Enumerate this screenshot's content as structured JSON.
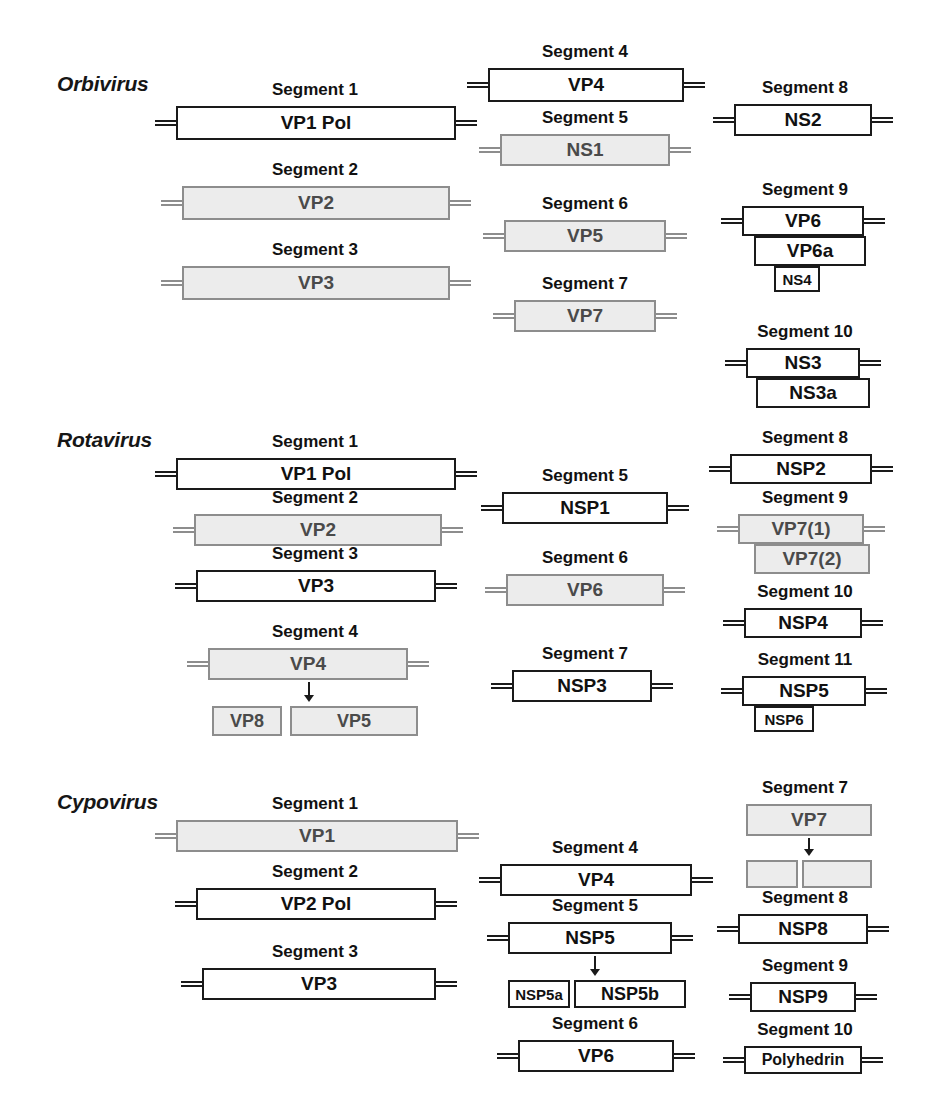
{
  "figure": {
    "width": 930,
    "height": 1109,
    "background": "#ffffff",
    "colors": {
      "box_stroke_dark": "#1a1a1a",
      "box_stroke_gray": "#8d8d8d",
      "box_fill_white": "#ffffff",
      "box_fill_gray": "#ececec",
      "text_dark": "#111111",
      "text_gray": "#4a4a4a"
    }
  },
  "genera": [
    {
      "name": "Orbivirus",
      "label_x": 57,
      "label_y": 72,
      "segments": [
        {
          "title": "Segment 1",
          "x": 150,
          "y": 80,
          "w": 330,
          "title_w": 330,
          "orfs": [
            {
              "label": "VP1 Pol",
              "x": 26,
              "y": 26,
              "w": 280,
              "h": 34,
              "style": "fill-white",
              "font": 19,
              "utr_left": true,
              "utr_right": true
            }
          ]
        },
        {
          "title": "Segment 2",
          "x": 150,
          "y": 160,
          "w": 330,
          "title_w": 330,
          "orfs": [
            {
              "label": "VP2",
              "x": 32,
              "y": 26,
              "w": 268,
              "h": 34,
              "style": "fill-gray",
              "font": 19,
              "utr_left": true,
              "utr_right": true
            }
          ]
        },
        {
          "title": "Segment 3",
          "x": 150,
          "y": 240,
          "w": 330,
          "title_w": 330,
          "orfs": [
            {
              "label": "VP3",
              "x": 32,
              "y": 26,
              "w": 268,
              "h": 34,
              "style": "fill-gray",
              "font": 19,
              "utr_left": true,
              "utr_right": true
            }
          ]
        },
        {
          "title": "Segment 4",
          "x": 460,
          "y": 42,
          "w": 250,
          "title_w": 250,
          "orfs": [
            {
              "label": "VP4",
              "x": 28,
              "y": 26,
              "w": 196,
              "h": 34,
              "style": "fill-white",
              "font": 19,
              "utr_left": true,
              "utr_right": true
            }
          ]
        },
        {
          "title": "Segment 5",
          "x": 460,
          "y": 108,
          "w": 250,
          "title_w": 250,
          "orfs": [
            {
              "label": "NS1",
              "x": 40,
              "y": 26,
              "w": 170,
              "h": 32,
              "style": "fill-gray",
              "font": 19,
              "utr_left": true,
              "utr_right": true
            }
          ]
        },
        {
          "title": "Segment 6",
          "x": 460,
          "y": 194,
          "w": 250,
          "title_w": 250,
          "orfs": [
            {
              "label": "VP5",
              "x": 44,
              "y": 26,
              "w": 162,
              "h": 32,
              "style": "fill-gray",
              "font": 19,
              "utr_left": true,
              "utr_right": true
            }
          ]
        },
        {
          "title": "Segment 7",
          "x": 460,
          "y": 274,
          "w": 250,
          "title_w": 250,
          "orfs": [
            {
              "label": "VP7",
              "x": 54,
              "y": 26,
              "w": 142,
              "h": 32,
              "style": "fill-gray",
              "font": 19,
              "utr_left": true,
              "utr_right": true
            }
          ]
        },
        {
          "title": "Segment 8",
          "x": 700,
          "y": 78,
          "w": 210,
          "title_w": 210,
          "orfs": [
            {
              "label": "NS2",
              "x": 34,
              "y": 26,
              "w": 138,
              "h": 32,
              "style": "fill-white",
              "font": 19,
              "utr_left": true,
              "utr_right": true
            }
          ]
        },
        {
          "title": "Segment 9",
          "x": 700,
          "y": 180,
          "w": 210,
          "title_w": 210,
          "orfs": [
            {
              "label": "VP6",
              "x": 42,
              "y": 26,
              "w": 122,
              "h": 30,
              "style": "fill-white",
              "font": 19,
              "utr_left": true,
              "utr_right": true
            },
            {
              "label": "VP6a",
              "x": 54,
              "y": 56,
              "w": 112,
              "h": 30,
              "style": "fill-white",
              "font": 19,
              "utr_left": false,
              "utr_right": false
            },
            {
              "label": "NS4",
              "x": 74,
              "y": 86,
              "w": 46,
              "h": 26,
              "style": "fill-white",
              "font": 15,
              "utr_left": false,
              "utr_right": false
            }
          ]
        },
        {
          "title": "Segment 10",
          "x": 700,
          "y": 322,
          "w": 210,
          "title_w": 210,
          "orfs": [
            {
              "label": "NS3",
              "x": 46,
              "y": 26,
              "w": 114,
              "h": 30,
              "style": "fill-white",
              "font": 19,
              "utr_left": true,
              "utr_right": true
            },
            {
              "label": "NS3a",
              "x": 56,
              "y": 56,
              "w": 114,
              "h": 30,
              "style": "fill-white",
              "font": 19,
              "utr_left": false,
              "utr_right": false
            }
          ]
        }
      ]
    },
    {
      "name": "Rotavirus",
      "label_x": 57,
      "label_y": 428,
      "segments": [
        {
          "title": "Segment 1",
          "x": 150,
          "y": 432,
          "w": 330,
          "title_w": 330,
          "orfs": [
            {
              "label": "VP1 Pol",
              "x": 26,
              "y": 26,
              "w": 280,
              "h": 32,
              "style": "fill-white",
              "font": 19,
              "utr_left": true,
              "utr_right": true
            }
          ]
        },
        {
          "title": "Segment 2",
          "x": 150,
          "y": 488,
          "w": 330,
          "title_w": 330,
          "orfs": [
            {
              "label": "VP2",
              "x": 44,
              "y": 26,
              "w": 248,
              "h": 32,
              "style": "fill-gray",
              "font": 19,
              "utr_left": true,
              "utr_right": true
            }
          ]
        },
        {
          "title": "Segment 3",
          "x": 150,
          "y": 544,
          "w": 330,
          "title_w": 330,
          "orfs": [
            {
              "label": "VP3",
              "x": 46,
              "y": 26,
              "w": 240,
              "h": 32,
              "style": "fill-white",
              "font": 19,
              "utr_left": true,
              "utr_right": true
            }
          ]
        },
        {
          "title": "Segment 4",
          "x": 150,
          "y": 622,
          "w": 330,
          "title_w": 330,
          "orfs": [
            {
              "label": "VP4",
              "x": 58,
              "y": 26,
              "w": 200,
              "h": 32,
              "style": "fill-gray",
              "font": 19,
              "utr_left": true,
              "utr_right": true
            }
          ],
          "arrow": {
            "x": 152,
            "y": 60,
            "h": 20
          },
          "products": [
            {
              "label": "VP8",
              "x": 62,
              "y": 84,
              "w": 70,
              "h": 30,
              "style": "fill-gray",
              "font": 18
            },
            {
              "label": "VP5",
              "x": 140,
              "y": 84,
              "w": 128,
              "h": 30,
              "style": "fill-gray",
              "font": 18
            }
          ]
        },
        {
          "title": "Segment 5",
          "x": 460,
          "y": 466,
          "w": 250,
          "title_w": 250,
          "orfs": [
            {
              "label": "NSP1",
              "x": 42,
              "y": 26,
              "w": 166,
              "h": 32,
              "style": "fill-white",
              "font": 19,
              "utr_left": true,
              "utr_right": true
            }
          ]
        },
        {
          "title": "Segment 6",
          "x": 460,
          "y": 548,
          "w": 250,
          "title_w": 250,
          "orfs": [
            {
              "label": "VP6",
              "x": 46,
              "y": 26,
              "w": 158,
              "h": 32,
              "style": "fill-gray",
              "font": 19,
              "utr_left": true,
              "utr_right": true
            }
          ]
        },
        {
          "title": "Segment 7",
          "x": 460,
          "y": 644,
          "w": 250,
          "title_w": 250,
          "orfs": [
            {
              "label": "NSP3",
              "x": 52,
              "y": 26,
              "w": 140,
              "h": 32,
              "style": "fill-white",
              "font": 19,
              "utr_left": true,
              "utr_right": true
            }
          ]
        },
        {
          "title": "Segment 8",
          "x": 700,
          "y": 428,
          "w": 210,
          "title_w": 210,
          "orfs": [
            {
              "label": "NSP2",
              "x": 30,
              "y": 26,
              "w": 142,
              "h": 30,
              "style": "fill-white",
              "font": 19,
              "utr_left": true,
              "utr_right": true
            }
          ]
        },
        {
          "title": "Segment 9",
          "x": 700,
          "y": 488,
          "w": 210,
          "title_w": 210,
          "orfs": [
            {
              "label": "VP7(1)",
              "x": 38,
              "y": 26,
              "w": 126,
              "h": 30,
              "style": "fill-gray",
              "font": 19,
              "utr_left": true,
              "utr_right": true
            },
            {
              "label": "VP7(2)",
              "x": 54,
              "y": 56,
              "w": 116,
              "h": 30,
              "style": "fill-gray",
              "font": 19,
              "utr_left": false,
              "utr_right": false
            }
          ]
        },
        {
          "title": "Segment 10",
          "x": 700,
          "y": 582,
          "w": 210,
          "title_w": 210,
          "orfs": [
            {
              "label": "NSP4",
              "x": 44,
              "y": 26,
              "w": 118,
              "h": 30,
              "style": "fill-white",
              "font": 19,
              "utr_left": true,
              "utr_right": true
            }
          ]
        },
        {
          "title": "Segment 11",
          "x": 700,
          "y": 650,
          "w": 210,
          "title_w": 210,
          "orfs": [
            {
              "label": "NSP5",
              "x": 42,
              "y": 26,
              "w": 124,
              "h": 30,
              "style": "fill-white",
              "font": 19,
              "utr_left": true,
              "utr_right": true
            },
            {
              "label": "NSP6",
              "x": 54,
              "y": 56,
              "w": 60,
              "h": 26,
              "style": "fill-white",
              "font": 15,
              "utr_left": false,
              "utr_right": false
            }
          ]
        }
      ]
    },
    {
      "name": "Cypovirus",
      "label_x": 57,
      "label_y": 790,
      "segments": [
        {
          "title": "Segment 1",
          "x": 150,
          "y": 794,
          "w": 330,
          "title_w": 330,
          "orfs": [
            {
              "label": "VP1",
              "x": 26,
              "y": 26,
              "w": 282,
              "h": 32,
              "style": "fill-gray",
              "font": 19,
              "utr_left": true,
              "utr_right": true
            }
          ]
        },
        {
          "title": "Segment 2",
          "x": 150,
          "y": 862,
          "w": 330,
          "title_w": 330,
          "orfs": [
            {
              "label": "VP2 Pol",
              "x": 46,
              "y": 26,
              "w": 240,
              "h": 32,
              "style": "fill-white",
              "font": 19,
              "utr_left": true,
              "utr_right": true
            }
          ]
        },
        {
          "title": "Segment 3",
          "x": 150,
          "y": 942,
          "w": 330,
          "title_w": 330,
          "orfs": [
            {
              "label": "VP3",
              "x": 52,
              "y": 26,
              "w": 234,
              "h": 32,
              "style": "fill-white",
              "font": 19,
              "utr_left": true,
              "utr_right": true
            }
          ]
        },
        {
          "title": "Segment 4",
          "x": 470,
          "y": 838,
          "w": 250,
          "title_w": 250,
          "orfs": [
            {
              "label": "VP4",
              "x": 30,
              "y": 26,
              "w": 192,
              "h": 32,
              "style": "fill-white",
              "font": 19,
              "utr_left": true,
              "utr_right": true
            }
          ]
        },
        {
          "title": "Segment 5",
          "x": 470,
          "y": 896,
          "w": 250,
          "title_w": 250,
          "orfs": [
            {
              "label": "NSP5",
              "x": 38,
              "y": 26,
              "w": 164,
              "h": 32,
              "style": "fill-white",
              "font": 19,
              "utr_left": true,
              "utr_right": true
            }
          ],
          "arrow": {
            "x": 118,
            "y": 60,
            "h": 20
          },
          "products": [
            {
              "label": "NSP5a",
              "x": 38,
              "y": 84,
              "w": 62,
              "h": 28,
              "style": "fill-white",
              "font": 15
            },
            {
              "label": "NSP5b",
              "x": 104,
              "y": 84,
              "w": 112,
              "h": 28,
              "style": "fill-white",
              "font": 18
            }
          ]
        },
        {
          "title": "Segment 6",
          "x": 470,
          "y": 1014,
          "w": 250,
          "title_w": 250,
          "orfs": [
            {
              "label": "VP6",
              "x": 48,
              "y": 26,
              "w": 156,
              "h": 32,
              "style": "fill-white",
              "font": 19,
              "utr_left": true,
              "utr_right": true
            }
          ]
        },
        {
          "title": "Segment 7",
          "x": 700,
          "y": 778,
          "w": 210,
          "title_w": 210,
          "orfs": [
            {
              "label": "VP7",
              "x": 46,
              "y": 26,
              "w": 126,
              "h": 32,
              "style": "fill-gray",
              "font": 19,
              "utr_left": false,
              "utr_right": false
            }
          ],
          "arrow": {
            "x": 102,
            "y": 60,
            "h": 18
          },
          "products": [
            {
              "label": "",
              "x": 46,
              "y": 82,
              "w": 52,
              "h": 28,
              "style": "fill-gray",
              "font": 15
            },
            {
              "label": "",
              "x": 102,
              "y": 82,
              "w": 70,
              "h": 28,
              "style": "fill-gray",
              "font": 15
            }
          ]
        },
        {
          "title": "Segment 8",
          "x": 700,
          "y": 888,
          "w": 210,
          "title_w": 210,
          "orfs": [
            {
              "label": "NSP8",
              "x": 38,
              "y": 26,
              "w": 130,
              "h": 30,
              "style": "fill-white",
              "font": 19,
              "utr_left": true,
              "utr_right": true
            }
          ]
        },
        {
          "title": "Segment 9",
          "x": 700,
          "y": 956,
          "w": 210,
          "title_w": 210,
          "orfs": [
            {
              "label": "NSP9",
              "x": 50,
              "y": 26,
              "w": 106,
              "h": 30,
              "style": "fill-white",
              "font": 19,
              "utr_left": true,
              "utr_right": true
            }
          ]
        },
        {
          "title": "Segment 10",
          "x": 700,
          "y": 1020,
          "w": 210,
          "title_w": 210,
          "orfs": [
            {
              "label": "Polyhedrin",
              "x": 44,
              "y": 26,
              "w": 118,
              "h": 28,
              "style": "fill-white",
              "font": 16,
              "utr_left": true,
              "utr_right": true
            }
          ]
        }
      ]
    }
  ]
}
